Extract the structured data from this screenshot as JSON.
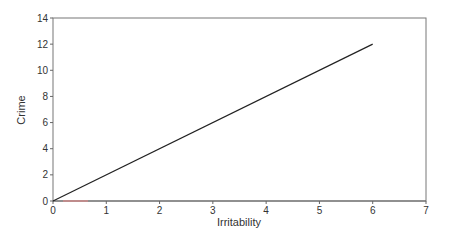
{
  "chart_data": {
    "type": "line",
    "title": "",
    "xlabel": "Irritability",
    "ylabel": "Crime",
    "xlim": [
      0,
      7
    ],
    "ylim": [
      0,
      14
    ],
    "xticks": [
      0,
      1,
      2,
      3,
      4,
      5,
      6,
      7
    ],
    "yticks": [
      0,
      2,
      4,
      6,
      8,
      10,
      12,
      14
    ],
    "grid": false,
    "legend": null,
    "series": [
      {
        "name": "Crime vs Irritability",
        "x": [
          0,
          6
        ],
        "y": [
          0,
          12
        ],
        "color": "#222222"
      }
    ]
  },
  "axes": {
    "xlabel": "Irritability",
    "ylabel": "Crime",
    "xtick_labels": [
      "0",
      "1",
      "2",
      "3",
      "4",
      "5",
      "6",
      "7"
    ],
    "ytick_labels": [
      "0",
      "2",
      "4",
      "6",
      "8",
      "10",
      "12",
      "14"
    ]
  }
}
